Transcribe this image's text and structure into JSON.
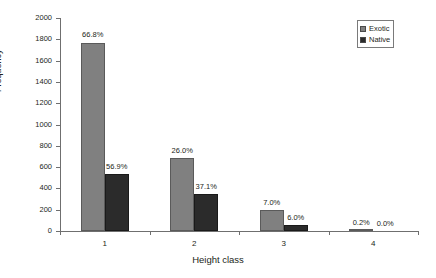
{
  "chart_data": {
    "type": "bar",
    "title": "",
    "xlabel": "Height class",
    "ylabel": "Frequency",
    "categories": [
      "1",
      "2",
      "3",
      "4"
    ],
    "ylim": [
      0,
      2000
    ],
    "yticks": [
      0,
      200,
      400,
      600,
      800,
      1000,
      1200,
      1400,
      1600,
      1800,
      2000
    ],
    "ytick_labels": [
      "0",
      "200",
      "400",
      "600",
      "800",
      "1000",
      "1200",
      "1400",
      "1600",
      "1800",
      "2000"
    ],
    "grid": false,
    "legend_position": "top-right",
    "series": [
      {
        "name": "Exotic",
        "color": "#808080",
        "values": [
          1770,
          690,
          195,
          12
        ],
        "data_labels": [
          "66.8%",
          "26.0%",
          "7.0%",
          "0.2%"
        ]
      },
      {
        "name": "Native",
        "color": "#2b2b2b",
        "values": [
          535,
          350,
          58,
          0
        ],
        "data_labels": [
          "56.9%",
          "37.1%",
          "6.0%",
          "0.0%"
        ]
      }
    ]
  }
}
